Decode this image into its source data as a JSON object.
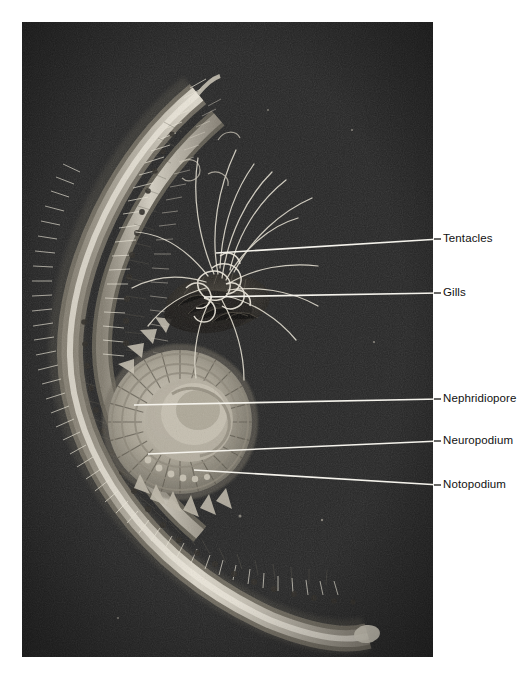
{
  "figure": {
    "kind": "labeled-anatomical-photograph",
    "background_color": "#ffffff",
    "photo": {
      "background_color": "#272727",
      "x": 22,
      "y": 22,
      "width": 411,
      "height": 635
    }
  },
  "labels": [
    {
      "id": "tentacles",
      "text": "Tentacles",
      "text_x": 443,
      "text_y": 237,
      "leader": {
        "x1": 216,
        "y1": 253,
        "x2": 440,
        "y2": 239
      }
    },
    {
      "id": "gills",
      "text": "Gills",
      "text_x": 443,
      "text_y": 290,
      "leader": {
        "x1": 204,
        "y1": 297,
        "x2": 440,
        "y2": 293
      }
    },
    {
      "id": "nephridiopore",
      "text": "Nephridiopore",
      "text_x": 443,
      "text_y": 396,
      "leader": {
        "x1": 134,
        "y1": 405,
        "x2": 440,
        "y2": 399
      }
    },
    {
      "id": "neuropodium",
      "text": "Neuropodium",
      "text_x": 443,
      "text_y": 438,
      "leader": {
        "x1": 148,
        "y1": 454,
        "x2": 440,
        "y2": 441
      }
    },
    {
      "id": "notopodium",
      "text": "Notopodium",
      "text_x": 443,
      "text_y": 482,
      "leader": {
        "x1": 194,
        "y1": 470,
        "x2": 440,
        "y2": 485
      }
    }
  ],
  "colors": {
    "leader_line": "#f2f2ee",
    "label_text": "#111111",
    "photo_dark": "#272727",
    "specimen_light": "#d8d3c6",
    "specimen_mid": "#9a958a",
    "specimen_shadow": "#3a3732"
  }
}
